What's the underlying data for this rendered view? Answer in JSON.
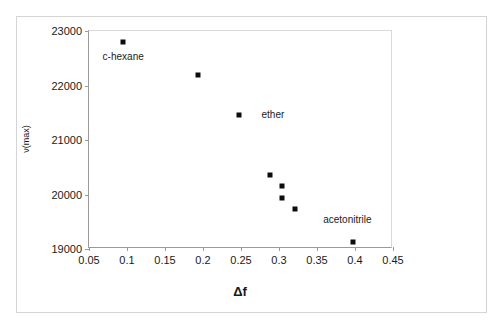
{
  "chart_data": {
    "type": "scatter",
    "title": "",
    "xlabel": "Δf",
    "ylabel": "ν(max)",
    "xlim": [
      0.05,
      0.45
    ],
    "ylim": [
      19000,
      23000
    ],
    "xticks": [
      "0.05",
      "0.1",
      "0.15",
      "0.2",
      "0.25",
      "0.3",
      "0.35",
      "0.4",
      "0.45"
    ],
    "xtick_values": [
      0.05,
      0.1,
      0.15,
      0.2,
      0.25,
      0.3,
      0.35,
      0.4,
      0.45
    ],
    "yticks": [
      "23000",
      "22000",
      "21000",
      "20000",
      "19000"
    ],
    "ytick_values": [
      23000,
      22000,
      21000,
      20000,
      19000
    ],
    "grid": false,
    "legend": false,
    "marker": "square",
    "marker_color": "#0d0d0d",
    "points": [
      {
        "x": 0.095,
        "y": 22800,
        "label": "c-hexane"
      },
      {
        "x": 0.193,
        "y": 22190,
        "label": ""
      },
      {
        "x": 0.248,
        "y": 21460,
        "label": "ether"
      },
      {
        "x": 0.288,
        "y": 20350,
        "label": ""
      },
      {
        "x": 0.304,
        "y": 20150,
        "label": ""
      },
      {
        "x": 0.304,
        "y": 19930,
        "label": ""
      },
      {
        "x": 0.321,
        "y": 19730,
        "label": ""
      },
      {
        "x": 0.397,
        "y": 19130,
        "label": "acetonitrile"
      }
    ],
    "annotations": [
      {
        "text": "c-hexane",
        "x": 0.095,
        "y": 22530,
        "align": "center"
      },
      {
        "text": "ether",
        "x": 0.277,
        "y": 21460,
        "align": "left"
      },
      {
        "text": "acetonitrile",
        "x": 0.39,
        "y": 19540,
        "align": "center"
      }
    ]
  }
}
